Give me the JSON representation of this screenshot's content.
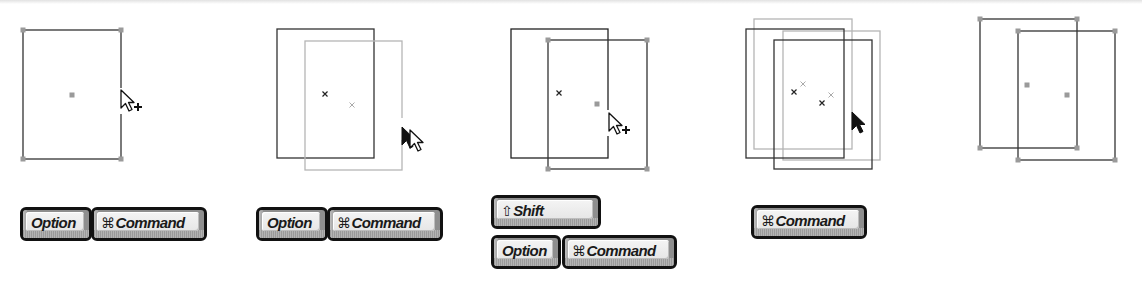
{
  "colors": {
    "dark_stroke": "#222222",
    "light_stroke": "#b5b5b5",
    "handle": "#9a9a9a",
    "key_frame": "#111111",
    "key_face": "#eeeeee"
  },
  "steps": [
    {
      "id": 1,
      "description": "Selected rectangle with corner handles; cursor on right edge showing duplicate (+) pointer",
      "cursor": "arrow-plus",
      "keys": [
        {
          "glyph": "",
          "label": "Option"
        },
        {
          "glyph": "⌘",
          "label": "Command"
        }
      ]
    },
    {
      "id": 2,
      "description": "Dragging a copy; original in dark outline, preview in light gray",
      "cursor": "drag-double-arrow",
      "keys": [
        {
          "glyph": "",
          "label": "Option"
        },
        {
          "glyph": "⌘",
          "label": "Command"
        }
      ]
    },
    {
      "id": 3,
      "description": "Copy placed offset with handles; cursor shows duplicate (+) pointer",
      "cursor": "arrow-plus",
      "keys": [
        {
          "glyph": "⇧",
          "label": "Shift"
        },
        {
          "glyph": "",
          "label": "Option"
        },
        {
          "glyph": "⌘",
          "label": "Command"
        }
      ]
    },
    {
      "id": 4,
      "description": "Moving both rectangles; previews shown in light gray",
      "cursor": "arrow-filled",
      "keys": [
        {
          "glyph": "⌘",
          "label": "Command"
        }
      ]
    },
    {
      "id": 5,
      "description": "Final result: two selected offset rectangles",
      "cursor": "",
      "keys": []
    }
  ]
}
